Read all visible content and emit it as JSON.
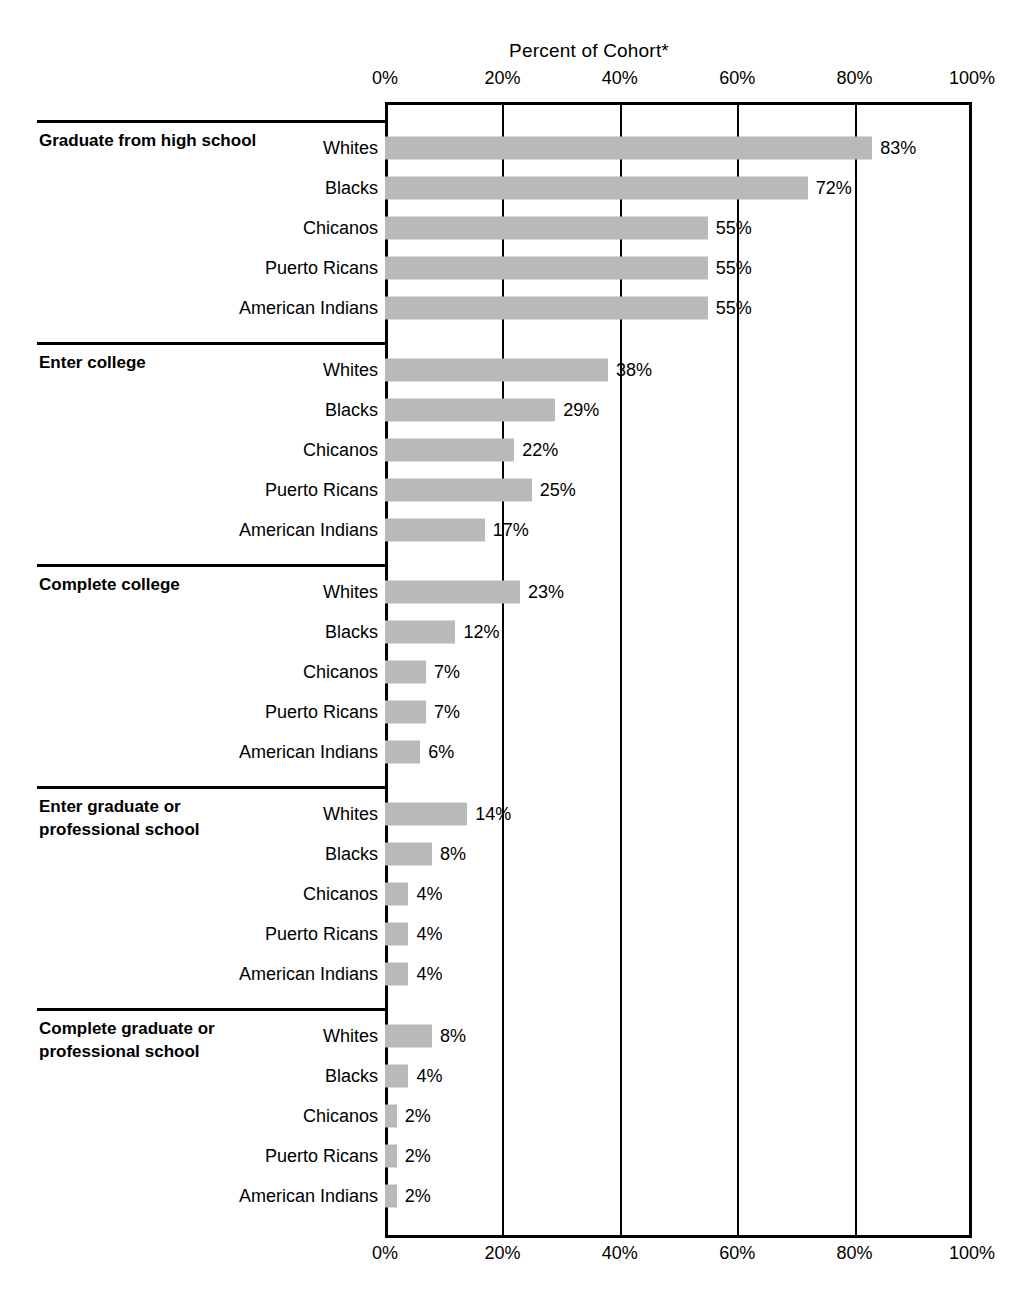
{
  "chart_data": {
    "type": "bar",
    "orientation": "horizontal",
    "title": "Percent of Cohort*",
    "xlabel": "",
    "ylabel": "",
    "xlim": [
      0,
      100
    ],
    "xticks": [
      0,
      20,
      40,
      60,
      80,
      100
    ],
    "xticklabels": [
      "0%",
      "20%",
      "40%",
      "60%",
      "80%",
      "100%"
    ],
    "grid": true,
    "legend": false,
    "value_suffix": "%",
    "bar_color": "#b9b9b9",
    "axis_color": "#000000",
    "categories": [
      "Whites",
      "Blacks",
      "Chicanos",
      "Puerto Ricans",
      "American Indians"
    ],
    "groups": [
      {
        "label": "Graduate from high school",
        "values": [
          83,
          72,
          55,
          55,
          55
        ],
        "value_labels": [
          "83%",
          "72%",
          "55%",
          "55%",
          "55%"
        ]
      },
      {
        "label": "Enter college",
        "values": [
          38,
          29,
          22,
          25,
          17
        ],
        "value_labels": [
          "38%",
          "29%",
          "22%",
          "25%",
          "17%"
        ]
      },
      {
        "label": "Complete college",
        "values": [
          23,
          12,
          7,
          7,
          6
        ],
        "value_labels": [
          "23%",
          "12%",
          "7%",
          "7%",
          "6%"
        ]
      },
      {
        "label": "Enter graduate or professional school",
        "values": [
          14,
          8,
          4,
          4,
          4
        ],
        "value_labels": [
          "14%",
          "8%",
          "4%",
          "4%",
          "4%"
        ]
      },
      {
        "label": "Complete graduate or professional school",
        "values": [
          8,
          4,
          2,
          2,
          2
        ],
        "value_labels": [
          "8%",
          "4%",
          "2%",
          "2%",
          "2%"
        ]
      }
    ]
  }
}
